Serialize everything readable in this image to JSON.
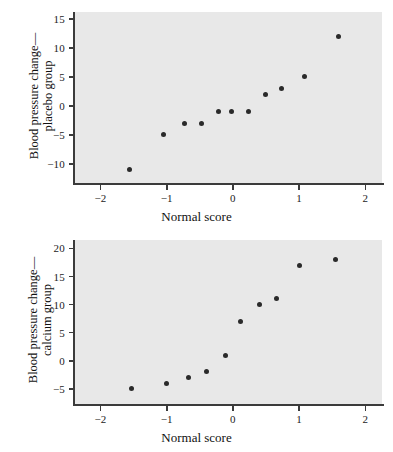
{
  "page": {
    "title": "Normal probability plots of blood pressure change",
    "background": "#ffffff",
    "plot_background": "#e8e8e8",
    "point_color": "#2a2a2a",
    "axis_color": "#3b3b3b"
  },
  "chart_data": [
    {
      "id": "placebo",
      "type": "scatter",
      "title": "",
      "xlabel": "Normal score",
      "ylabel": "Blood pressure change—\nplacebo group",
      "ylabel_lines": [
        "Blood pressure change—",
        "placebo group"
      ],
      "xlim": [
        -2.4,
        2.25
      ],
      "ylim": [
        -13.3,
        16.2
      ],
      "xticks": [
        -2,
        -1,
        0,
        1,
        2
      ],
      "xticklabels": [
        "−2",
        "−1",
        "0",
        "1",
        "2"
      ],
      "yticks": [
        -10,
        -5,
        0,
        5,
        10,
        15
      ],
      "yticklabels": [
        "−10",
        "−5",
        "0",
        "5",
        "10",
        "15"
      ],
      "grid": false,
      "legend": false,
      "x": [
        -1.56,
        -1.05,
        -0.73,
        -0.47,
        -0.22,
        -0.02,
        0.23,
        0.49,
        0.74,
        1.08,
        1.6
      ],
      "y": [
        -11,
        -5,
        -3,
        -3,
        -1,
        -1,
        -1,
        2,
        3,
        5,
        12
      ]
    },
    {
      "id": "calcium",
      "type": "scatter",
      "title": "",
      "xlabel": "Normal score",
      "ylabel": "Blood pressure change—\ncalcium group",
      "ylabel_lines": [
        "Blood pressure change—",
        "calcium group"
      ],
      "xlim": [
        -2.4,
        2.25
      ],
      "ylim": [
        -7.7,
        21.5
      ],
      "xticks": [
        -2,
        -1,
        0,
        1,
        2
      ],
      "xticklabels": [
        "−2",
        "−1",
        "0",
        "1",
        "2"
      ],
      "yticks": [
        -5,
        0,
        5,
        10,
        15,
        20
      ],
      "yticklabels": [
        "−5",
        "0",
        "5",
        "10",
        "15",
        "20"
      ],
      "grid": false,
      "legend": false,
      "x": [
        -1.53,
        -1.0,
        -0.67,
        -0.4,
        -0.12,
        0.11,
        0.4,
        0.66,
        1.0,
        1.55
      ],
      "y": [
        -5,
        -4,
        -3,
        -2,
        1,
        7,
        10,
        11,
        17,
        18
      ]
    }
  ]
}
